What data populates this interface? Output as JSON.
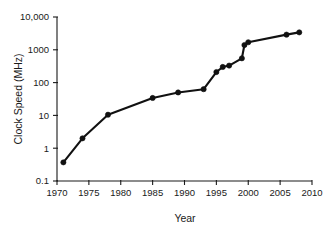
{
  "chart_data": {
    "type": "line",
    "title": "",
    "xlabel": "Year",
    "ylabel": "Clock Speed (MHz)",
    "xlim": [
      1970,
      2010
    ],
    "ylim": [
      0.1,
      10000
    ],
    "yscale": "log",
    "xscale": "linear",
    "grid": false,
    "legend": "none",
    "xticks": [
      1970,
      1975,
      1980,
      1985,
      1990,
      1995,
      2000,
      2005,
      2010
    ],
    "xtick_labels": [
      "1970",
      "1975",
      "1980",
      "1985",
      "1990",
      "1995",
      "2000",
      "2005",
      "2010"
    ],
    "yticks": [
      0.1,
      1,
      10,
      100,
      1000,
      10000
    ],
    "ytick_labels": [
      "0.1",
      "1",
      "10",
      "100",
      "1000",
      "10,000"
    ],
    "series": [
      {
        "name": "Clock Speed",
        "marker": "filled-circle",
        "color": "#111111",
        "x": [
          1971,
          1974,
          1978,
          1985,
          1989,
          1993,
          1995,
          1996,
          1997,
          1999,
          1999.4,
          2000,
          2006,
          2008
        ],
        "y": [
          0.37,
          2.0,
          10.5,
          34,
          50,
          63,
          210,
          300,
          330,
          550,
          1400,
          1700,
          2900,
          3400
        ],
        "points": [
          {
            "x": 1971,
            "y": 0.37
          },
          {
            "x": 1974,
            "y": 2.0
          },
          {
            "x": 1978,
            "y": 10.5
          },
          {
            "x": 1985,
            "y": 34
          },
          {
            "x": 1989,
            "y": 50
          },
          {
            "x": 1993,
            "y": 63
          },
          {
            "x": 1995,
            "y": 210
          },
          {
            "x": 1996,
            "y": 300
          },
          {
            "x": 1997,
            "y": 330
          },
          {
            "x": 1999,
            "y": 550
          },
          {
            "x": 1999.4,
            "y": 1400
          },
          {
            "x": 2000,
            "y": 1700
          },
          {
            "x": 2006,
            "y": 2900
          },
          {
            "x": 2008,
            "y": 3400
          }
        ]
      }
    ]
  },
  "axes": {
    "x_title": "Year",
    "y_title": "Clock Speed (MHz)"
  }
}
